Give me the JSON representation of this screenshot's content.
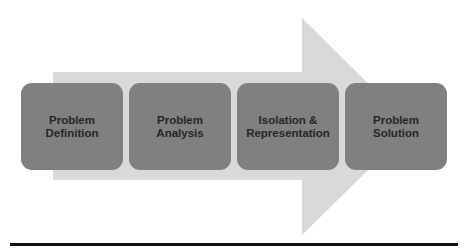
{
  "diagram": {
    "type": "process-flow",
    "direction": "left-to-right",
    "arrow": {
      "color": "#d9d9d9"
    },
    "steps": [
      {
        "label": "Problem\nDefinition"
      },
      {
        "label": "Problem\nAnalysis"
      },
      {
        "label": "Isolation &\nRepresentation"
      },
      {
        "label": "Problem\nSolution"
      }
    ],
    "colors": {
      "step_fill": "#808080",
      "step_text": "#262626",
      "baseline": "#111111"
    }
  }
}
